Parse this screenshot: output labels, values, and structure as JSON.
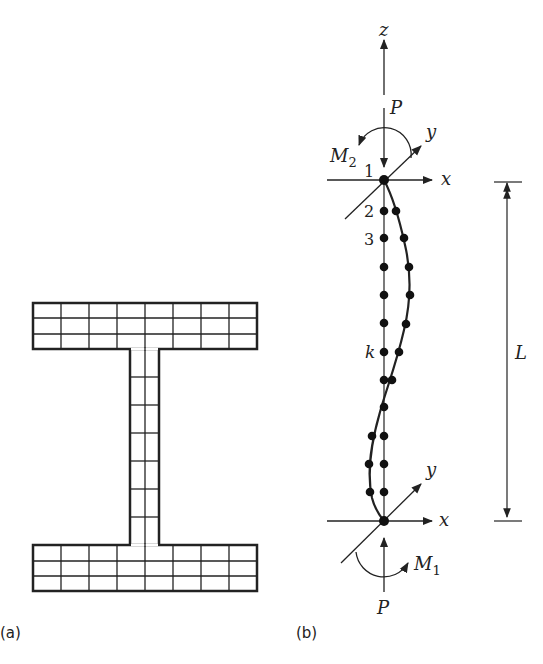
{
  "panel_a": {
    "caption": "(a)",
    "description": "I-section cross-section discretized into fiber mesh",
    "top_flange": {
      "columns": 8,
      "rows": 3
    },
    "web": {
      "columns": 2,
      "rows": 7
    },
    "bottom_flange": {
      "columns": 8,
      "rows": 3
    }
  },
  "panel_b": {
    "caption": "(b)",
    "axes": {
      "z": "z",
      "x_top": "x",
      "y_top": "y",
      "x_bottom": "x",
      "y_bottom": "y"
    },
    "loads": {
      "p_top": "P",
      "p_bottom": "P",
      "m_top": "M",
      "m_top_sub": "2",
      "m_bottom": "M",
      "m_bottom_sub": "1"
    },
    "node_labels": {
      "n1": "1",
      "n2": "2",
      "n3": "3",
      "nk": "k"
    },
    "dimension": {
      "length": "L"
    }
  },
  "colors": {
    "stroke": "#222222",
    "background": "#ffffff"
  }
}
